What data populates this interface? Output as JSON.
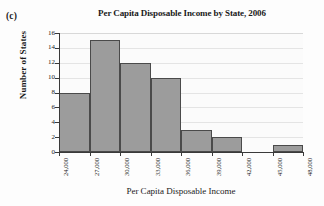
{
  "figure": {
    "panel_label": "(c)"
  },
  "chart_data": {
    "type": "bar",
    "title": "Per Capita Disposable Income by State, 2006",
    "xlabel": "Per Capita Disposable Income",
    "ylabel": "Number of States",
    "bin_edges": [
      "24,000",
      "27,000",
      "30,000",
      "33,000",
      "36,000",
      "39,000",
      "42,000",
      "45,000",
      "48,000"
    ],
    "categories": [
      "24,000-27,000",
      "27,000-30,000",
      "30,000-33,000",
      "33,000-36,000",
      "36,000-39,000",
      "39,000-42,000",
      "42,000-45,000",
      "45,000-48,000"
    ],
    "values": [
      8,
      15,
      12,
      10,
      3,
      2,
      0,
      1
    ],
    "xtick_labels": [
      "24,000",
      "27,000",
      "30,000",
      "33,000",
      "36,000",
      "39,000",
      "42,000",
      "45,000",
      "48,000"
    ],
    "ytick_labels": [
      "0",
      "2",
      "4",
      "6",
      "8",
      "10",
      "12",
      "14",
      "16"
    ],
    "ytick_values": [
      0,
      2,
      4,
      6,
      8,
      10,
      12,
      14,
      16
    ],
    "ylim": [
      0,
      16
    ],
    "xlim": [
      "24,000",
      "48,000"
    ],
    "grid": "horizontal",
    "legend": "none",
    "colors": {
      "bar_fill": "#9c9c9c",
      "bar_edge": "#4a4a4a",
      "gridline": "#e4e4e4",
      "axis": "#3a3a3a",
      "plot_background": "#fbfbfb",
      "figure_background": "#fdfdfd",
      "text": "#1a1a1a"
    }
  }
}
